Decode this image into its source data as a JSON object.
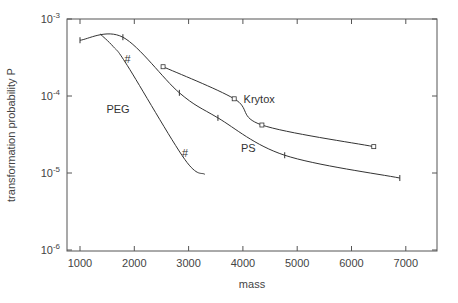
{
  "chart_data": {
    "type": "line",
    "title": "",
    "xlabel": "mass",
    "ylabel": "transformation probability P",
    "xlim": [
      800,
      7600
    ],
    "ylim": [
      1e-06,
      0.001
    ],
    "yscale": "log",
    "grid": false,
    "x_ticks": [
      "1000",
      "2000",
      "3000",
      "4000",
      "5000",
      "6000",
      "7000"
    ],
    "y_ticks": [
      {
        "base": "10",
        "exp": "-3"
      },
      {
        "base": "10",
        "exp": "-4"
      },
      {
        "base": "10",
        "exp": "-5"
      },
      {
        "base": "10",
        "exp": "-6"
      }
    ],
    "series": [
      {
        "name": "PS",
        "marker": "tick",
        "x": [
          1000,
          1790,
          2830,
          3540,
          4770,
          6890
        ],
        "y": [
          0.00053,
          0.00058,
          0.00011,
          5.2e-05,
          1.7e-05,
          8.6e-06
        ]
      },
      {
        "name": "Krytox",
        "marker": "square",
        "x": [
          2530,
          3840,
          4350,
          6410
        ],
        "y": [
          0.00024,
          9.2e-05,
          4.2e-05,
          2.2e-05
        ]
      },
      {
        "name": "PEG",
        "marker": "hash",
        "x": [
          1370,
          1610,
          1870,
          2930,
          3300
        ],
        "y": [
          0.00064,
          0.00044,
          0.00025,
          1.5e-05,
          9.6e-06
        ]
      }
    ],
    "annotations": [
      {
        "text": "PEG",
        "x": 1700,
        "y": 6e-05
      },
      {
        "text": "Krytox",
        "x": 4300,
        "y": 8e-05
      },
      {
        "text": "PS",
        "x": 4100,
        "y": 1.9e-05
      },
      {
        "text": "#",
        "x": 1870,
        "y": 0.00027
      },
      {
        "text": "#",
        "x": 2930,
        "y": 1.6e-05
      }
    ]
  }
}
